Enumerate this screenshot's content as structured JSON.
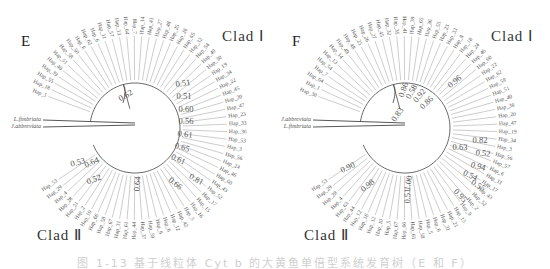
{
  "figure": {
    "caption": "图 1-13 基于线粒体 Cyt b 的大黄鱼单倍型系统发育树（E 和 F）",
    "line_color": "#444444",
    "label_color": "#555555"
  },
  "panels": [
    {
      "letter": "E",
      "clade1_label": "Clad Ⅰ",
      "clade2_label": "Clad Ⅱ",
      "outgroups": [
        "L.fimbriata",
        "J.abbreviata"
      ],
      "upper_arc_labels": [
        "Hap_1",
        "Hap_18",
        "Hap_55",
        "Hap_39",
        "Hap_40",
        "Hap_51",
        "Hap_58",
        "Hap_50",
        "Hap_6",
        "Hap_62",
        "Hap_6",
        "Hap_11",
        "Hap_57",
        "Hap_13",
        "Hap_64",
        "Hap_7",
        "Hap_14",
        "Hap_41",
        "Hap_27",
        "Hap_48",
        "Hap_25",
        "Hap_26",
        "Hap_65",
        "Hap_32",
        "Hap_54",
        "Hap_49",
        "Hap_30"
      ],
      "right_arc_labels": [
        "Hap_19",
        "Hap_34",
        "Hap_22",
        "Hap_45",
        "Hap_20",
        "Hap_47",
        "Hap_23",
        "Hap_33",
        "Hap_36",
        "Hap_53",
        "Hap_3",
        "Hap_56",
        "Hap_24",
        "Hap_46",
        "Hap_60",
        "Hap_43",
        "Hap_52",
        "Hap_17",
        "Hap_15",
        "Hap_16",
        "Hap_5",
        "Hap_42"
      ],
      "lower_arc_labels": [
        "Hap_12",
        "Hap_6",
        "Hap_9",
        "Hap_59",
        "Hap_37",
        "Hap_44",
        "Hap_61",
        "Hap_31",
        "Hap_67",
        "Hap_58",
        "Hap_66",
        "Hap_10",
        "Hap_2",
        "Hap_21",
        "Hap_28",
        "Hap_4",
        "Hap_29",
        "Hap_53"
      ],
      "support_values": [
        {
          "v": "0.62",
          "x": 126,
          "y": 96,
          "r": -30
        },
        {
          "v": "0.51",
          "x": 183,
          "y": 84,
          "r": -8
        },
        {
          "v": "0.51",
          "x": 184,
          "y": 97,
          "r": 0
        },
        {
          "v": "0.60",
          "x": 186,
          "y": 110,
          "r": 0
        },
        {
          "v": "0.56",
          "x": 186,
          "y": 122,
          "r": 0
        },
        {
          "v": "0.61",
          "x": 185,
          "y": 135,
          "r": 8
        },
        {
          "v": "0.65",
          "x": 182,
          "y": 148,
          "r": 15
        },
        {
          "v": "0.61",
          "x": 178,
          "y": 160,
          "r": 25
        },
        {
          "v": "0.81",
          "x": 196,
          "y": 180,
          "r": 30
        },
        {
          "v": "0.66",
          "x": 175,
          "y": 184,
          "r": 38
        },
        {
          "v": "0.64",
          "x": 138,
          "y": 184,
          "r": -85
        },
        {
          "v": "0.53",
          "x": 78,
          "y": 163,
          "r": -15
        },
        {
          "v": "0.64",
          "x": 92,
          "y": 163,
          "r": -25
        },
        {
          "v": "0.52",
          "x": 94,
          "y": 180,
          "r": -20
        }
      ]
    },
    {
      "letter": "F",
      "clade1_label": "Clad Ⅰ",
      "clade2_label": "Clad Ⅱ",
      "outgroups": [
        "J.abbreviata",
        "L.fimbriata"
      ],
      "upper_arc_labels": [
        "Hap_30",
        "Hap_1",
        "Hap_64",
        "Hap_7",
        "Hap_54",
        "Hap_13",
        "Hap_14",
        "Hap_49",
        "Hap_48",
        "Hap_25",
        "Hap_26",
        "Hap_27",
        "Hap_45",
        "Hap_32",
        "Hap_35",
        "Hap_41",
        "Hap_39",
        "Hap_65",
        "Hap_36",
        "Hap_55",
        "Hap_23",
        "Hap_33",
        "Hap_8",
        "Hap_18",
        "Hap_24",
        "Hap_46",
        "Hap_60"
      ],
      "right_arc_labels": [
        "Hap_22",
        "Hap_62",
        "Hap_59",
        "Hap_51",
        "Hap_40",
        "Hap_38",
        "Hap_20",
        "Hap_47",
        "Hap_19",
        "Hap_34",
        "Hap_3",
        "Hap_56",
        "Hap_57",
        "Hap_6",
        "Hap_11",
        "Hap_17",
        "Hap_43",
        "Hap_52",
        "Hap_2",
        "Hap_9",
        "Hap_15",
        "Hap_21"
      ],
      "lower_arc_labels": [
        "Hap_31",
        "Hap_6",
        "Hap_5",
        "Hap_58",
        "Hap_61",
        "Hap_66",
        "Hap_67",
        "Hap_5",
        "Hap_10",
        "Hap_12",
        "Hap_16",
        "Hap_12",
        "Hap_44",
        "Hap_63",
        "Hap_4",
        "Hap_28",
        "Hap_29",
        "Hap_53"
      ],
      "support_values": [
        {
          "v": "0.83",
          "x": 398,
          "y": 115,
          "r": -55
        },
        {
          "v": "0.86",
          "x": 404,
          "y": 90,
          "r": -70
        },
        {
          "v": "0.58",
          "x": 412,
          "y": 92,
          "r": -60
        },
        {
          "v": "0.92",
          "x": 420,
          "y": 96,
          "r": -50
        },
        {
          "v": "0.86",
          "x": 427,
          "y": 103,
          "r": -45
        },
        {
          "v": "0.96",
          "x": 455,
          "y": 82,
          "r": -40
        },
        {
          "v": "0.63",
          "x": 460,
          "y": 148,
          "r": 0
        },
        {
          "v": "0.82",
          "x": 480,
          "y": 141,
          "r": 0
        },
        {
          "v": "0.52",
          "x": 483,
          "y": 154,
          "r": 5
        },
        {
          "v": "0.94",
          "x": 478,
          "y": 167,
          "r": 15
        },
        {
          "v": "0.54",
          "x": 470,
          "y": 176,
          "r": 25
        },
        {
          "v": "0.55",
          "x": 478,
          "y": 186,
          "r": 30
        },
        {
          "v": "0.95",
          "x": 460,
          "y": 196,
          "r": 45
        },
        {
          "v": "1.00",
          "x": 409,
          "y": 183,
          "r": -80
        },
        {
          "v": "0.51",
          "x": 408,
          "y": 196,
          "r": -88
        },
        {
          "v": "0.98",
          "x": 368,
          "y": 186,
          "r": -40
        },
        {
          "v": "0.90",
          "x": 348,
          "y": 168,
          "r": -25
        }
      ]
    }
  ]
}
